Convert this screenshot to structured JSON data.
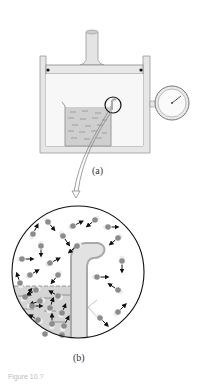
{
  "figure": {
    "panel_a_label": "(a)",
    "panel_b_label": "(b)",
    "caption": "Figure 10.?"
  },
  "colors": {
    "wall": "#e6e6e6",
    "wall_stroke": "#9a9a9a",
    "liquid": "#d0d0d0",
    "molecule": "#8c8c8c",
    "arrow": "#111111",
    "tube": "#e2e2e2",
    "tube_stroke": "#a8a8a8"
  },
  "molecules": [
    {
      "x": 48,
      "y": 222,
      "dx": 4,
      "dy": 5
    },
    {
      "x": 73,
      "y": 226,
      "dx": 6,
      "dy": -3
    },
    {
      "x": 95,
      "y": 220,
      "dx": -5,
      "dy": 4
    },
    {
      "x": 108,
      "y": 227,
      "dx": 6,
      "dy": 0
    },
    {
      "x": 33,
      "y": 234,
      "dx": 3,
      "dy": -6
    },
    {
      "x": 63,
      "y": 236,
      "dx": 4,
      "dy": 6
    },
    {
      "x": 118,
      "y": 238,
      "dx": -5,
      "dy": 4
    },
    {
      "x": 41,
      "y": 246,
      "dx": 0,
      "dy": 6
    },
    {
      "x": 77,
      "y": 246,
      "dx": -5,
      "dy": 4
    },
    {
      "x": 22,
      "y": 259,
      "dx": 7,
      "dy": 0
    },
    {
      "x": 50,
      "y": 263,
      "dx": 6,
      "dy": -3
    },
    {
      "x": 122,
      "y": 261,
      "dx": 0,
      "dy": 7
    },
    {
      "x": 58,
      "y": 275,
      "dx": -4,
      "dy": 5
    },
    {
      "x": 30,
      "y": 275,
      "dx": 5,
      "dy": -3
    },
    {
      "x": 97,
      "y": 277,
      "dx": 7,
      "dy": 0
    },
    {
      "x": 20,
      "y": 283,
      "dx": -2,
      "dy": -6
    },
    {
      "x": 118,
      "y": 290,
      "dx": -6,
      "dy": -4
    },
    {
      "x": 100,
      "y": 318,
      "dx": 5,
      "dy": 5
    },
    {
      "x": 118,
      "y": 312,
      "dx": 5,
      "dy": -5
    },
    {
      "x": 36,
      "y": 290,
      "dx": -5,
      "dy": 3
    },
    {
      "x": 58,
      "y": 296,
      "dx": -5,
      "dy": -3
    },
    {
      "x": 25,
      "y": 297,
      "dx": 4,
      "dy": -5
    },
    {
      "x": 40,
      "y": 301,
      "dx": -6,
      "dy": 2
    },
    {
      "x": 50,
      "y": 308,
      "dx": 2,
      "dy": -6
    },
    {
      "x": 32,
      "y": 306,
      "dx": 6,
      "dy": 0
    },
    {
      "x": 62,
      "y": 313,
      "dx": 2,
      "dy": -5
    },
    {
      "x": 38,
      "y": 320,
      "dx": -5,
      "dy": -3
    },
    {
      "x": 52,
      "y": 324,
      "dx": 0,
      "dy": -6
    },
    {
      "x": 64,
      "y": 326,
      "dx": 3,
      "dy": -6
    },
    {
      "x": 45,
      "y": 334,
      "dx": 0,
      "dy": 0
    },
    {
      "x": 62,
      "y": 335,
      "dx": 0,
      "dy": 0
    }
  ]
}
